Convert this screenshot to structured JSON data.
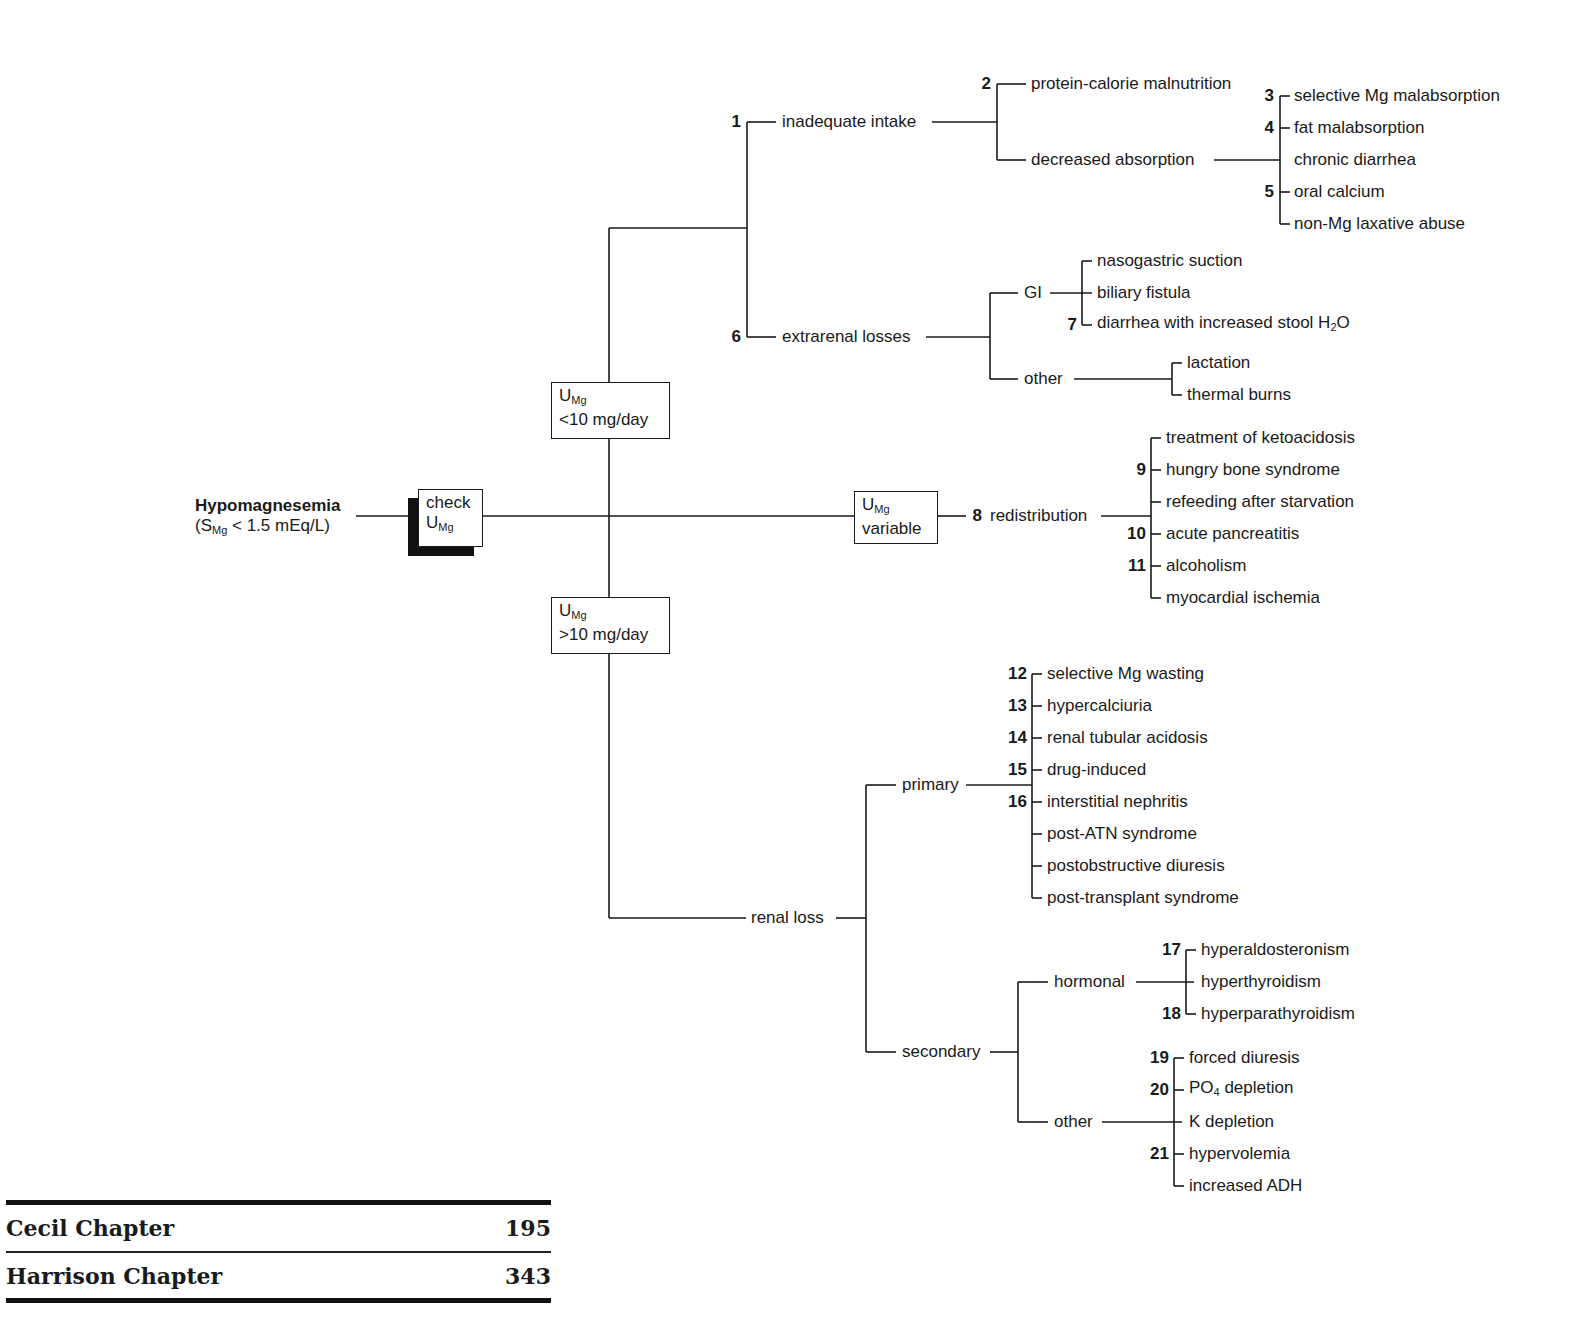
{
  "root": {
    "title": "Hypomagnesemia",
    "subtitle_prefix": "(S",
    "subtitle_sub": "Mg",
    "subtitle_suffix": " < 1.5 mEq/L)"
  },
  "check_box": {
    "line1": "check",
    "line2_main": "U",
    "line2_sub": "Mg"
  },
  "low_box": {
    "main": "U",
    "sub": "Mg",
    "line2": "<10 mg/day"
  },
  "high_box": {
    "main": "U",
    "sub": "Mg",
    "line2": ">10 mg/day"
  },
  "variable_box": {
    "main": "U",
    "sub": "Mg",
    "line2": "variable"
  },
  "low_branch": {
    "inadequate_intake": {
      "num": "1",
      "label": "inadequate intake"
    },
    "protein_calorie": {
      "num": "2",
      "label": "protein-calorie malnutrition"
    },
    "decreased_absorption": {
      "label": "decreased absorption"
    },
    "absorption_items": [
      {
        "num": "3",
        "label": "selective Mg malabsorption"
      },
      {
        "num": "4",
        "label": "fat malabsorption"
      },
      {
        "num": "",
        "label": "chronic diarrhea"
      },
      {
        "num": "5",
        "label": "oral calcium"
      },
      {
        "num": "",
        "label": "non-Mg laxative abuse"
      }
    ],
    "extrarenal_losses": {
      "num": "6",
      "label": "extrarenal losses"
    },
    "gi": {
      "label": "GI"
    },
    "gi_items": [
      {
        "num": "",
        "label": "nasogastric suction"
      },
      {
        "num": "",
        "label": "biliary fistula"
      },
      {
        "num": "7",
        "label": "diarrhea with increased stool H",
        "sub": "2",
        "suffix": "O"
      }
    ],
    "other": {
      "label": "other"
    },
    "other_items": [
      {
        "label": "lactation"
      },
      {
        "label": "thermal burns"
      }
    ]
  },
  "variable_branch": {
    "redistribution": {
      "num": "8",
      "label": "redistribution"
    },
    "items": [
      {
        "num": "",
        "label": "treatment of ketoacidosis"
      },
      {
        "num": "9",
        "label": "hungry bone syndrome"
      },
      {
        "num": "",
        "label": "refeeding after starvation"
      },
      {
        "num": "10",
        "label": "acute pancreatitis"
      },
      {
        "num": "11",
        "label": "alcoholism"
      },
      {
        "num": "",
        "label": "myocardial ischemia"
      }
    ]
  },
  "high_branch": {
    "renal_loss": {
      "label": "renal loss"
    },
    "primary": {
      "label": "primary"
    },
    "primary_items": [
      {
        "num": "12",
        "label": "selective Mg wasting"
      },
      {
        "num": "13",
        "label": "hypercalciuria"
      },
      {
        "num": "14",
        "label": "renal tubular acidosis"
      },
      {
        "num": "15",
        "label": "drug-induced"
      },
      {
        "num": "16",
        "label": "interstitial nephritis"
      },
      {
        "num": "",
        "label": "post-ATN syndrome"
      },
      {
        "num": "",
        "label": "postobstructive diuresis"
      },
      {
        "num": "",
        "label": "post-transplant syndrome"
      }
    ],
    "secondary": {
      "label": "secondary"
    },
    "hormonal": {
      "label": "hormonal"
    },
    "hormonal_items": [
      {
        "num": "17",
        "label": "hyperaldosteronism"
      },
      {
        "num": "",
        "label": "hyperthyroidism"
      },
      {
        "num": "18",
        "label": "hyperparathyroidism"
      }
    ],
    "other": {
      "label": "other"
    },
    "other_items": [
      {
        "num": "19",
        "label": "forced diuresis"
      },
      {
        "num": "20",
        "label": "PO",
        "sub": "4",
        "suffix": " depletion"
      },
      {
        "num": "",
        "label": "K depletion"
      },
      {
        "num": "21",
        "label": "hypervolemia"
      },
      {
        "num": "",
        "label": "increased ADH"
      }
    ]
  },
  "references": [
    {
      "label": "Cecil Chapter",
      "value": "195"
    },
    {
      "label": "Harrison Chapter",
      "value": "343"
    }
  ]
}
